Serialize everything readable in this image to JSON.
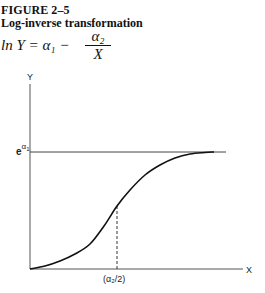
{
  "figure": {
    "number": "FIGURE 2–5",
    "title": "Log-inverse transformation",
    "equation_lhs": "ln  Y = α₁ −",
    "equation_num": "α₂",
    "equation_den": "X"
  },
  "chart_data": {
    "type": "line",
    "title": "Log-inverse transformation",
    "equation": "ln Y = α1 − α2/X",
    "xlabel": "X",
    "ylabel": "Y",
    "asymptote_label": "e^α1",
    "inflection_label": "(α₂/2)",
    "grid": false,
    "legend": null,
    "annotations": [
      {
        "type": "horizontal_asymptote",
        "label": "e^α1"
      },
      {
        "type": "dashed_vertical",
        "label": "(α₂/2)",
        "meaning": "inflection point at X = α2/2"
      }
    ],
    "series": [
      {
        "name": "Y = exp(α1 − α2/X)",
        "x_px": [
          30,
          45,
          60,
          75,
          90,
          104,
          117,
          130,
          145,
          160,
          175,
          190,
          205,
          214
        ],
        "y_px": [
          269,
          266,
          261,
          254,
          244,
          226,
          206,
          190,
          175,
          165,
          158,
          154,
          152.5,
          152
        ]
      }
    ]
  },
  "axes": {
    "y_label": "Y",
    "x_label": "X",
    "asym_base": "e",
    "asym_sup": "α",
    "asym_sub": "1",
    "tick_label": "(α₂/2)"
  }
}
